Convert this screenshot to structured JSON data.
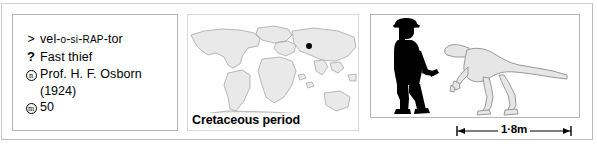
{
  "figure": {
    "panels": [
      "fact-list",
      "paleogeographic-map",
      "size-comparison"
    ]
  },
  "facts": {
    "rows": [
      {
        "symbol": "pronunciation-symbol",
        "symbol_glyph": ">",
        "label": "Pronunciation",
        "value": "vel-o-si-RAP-tor",
        "segments": [
          {
            "text": "vel-",
            "style": "normal"
          },
          {
            "text": "o",
            "style": "smallcap"
          },
          {
            "text": "-",
            "style": "normal"
          },
          {
            "text": "si",
            "style": "smallcap"
          },
          {
            "text": "-",
            "style": "normal"
          },
          {
            "text": "RAP",
            "style": "smallcap"
          },
          {
            "text": "-tor",
            "style": "normal"
          }
        ]
      },
      {
        "symbol": "meaning-symbol",
        "symbol_glyph": "?",
        "label": "Meaning",
        "value": "Fast thief"
      },
      {
        "symbol": "named-by-symbol",
        "symbol_glyph": "n",
        "symbol_circled": true,
        "label": "Named by",
        "value": "Prof. H. F. Osborn",
        "continuation": "(1924)"
      },
      {
        "symbol": "measurement-symbol",
        "symbol_glyph": "m",
        "symbol_circled": true,
        "label": "Measurement",
        "value": "50"
      }
    ]
  },
  "map": {
    "caption": "Cretaceous period",
    "marker_label": "fossil-find-location",
    "land_color": "#e8e8e8",
    "outline_color": "#9a9a9a",
    "marker_color": "#000000"
  },
  "scale": {
    "human_label": "human-silhouette",
    "dinosaur_label": "velociraptor-outline",
    "measurement": "1·8m",
    "human_color": "#000000",
    "dinosaur_fill": "#e4e4e4",
    "dinosaur_stroke": "#8f8f8f"
  }
}
